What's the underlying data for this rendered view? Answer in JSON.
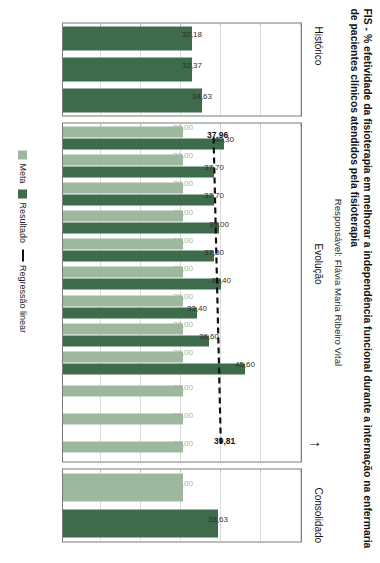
{
  "header": {
    "title": "FIS - % efetividade da fisioterapia em melhorar a independência funcional durante a internação na enfermaria de pacientes clínicos atendidos pela fisioterapia",
    "subtitle": "Responsável: Flávia Maria Ribeiro Vital"
  },
  "bands": {
    "historico": "Histórico",
    "evolucao": "Evolução",
    "consolidado": "Consolidado"
  },
  "legend": {
    "meta": "Meta",
    "resultado": "Resultado",
    "regressao": "Regressão linear"
  },
  "axis": {
    "ylabel": "%",
    "xlabel": "Mês/ano",
    "yticks": [
      "60,00",
      "50,00",
      "40,00",
      "30,00",
      "20,00",
      "10,00",
      "0,00"
    ],
    "period_evolucao": "2016"
  },
  "colors": {
    "meta": "#9db89f",
    "resultado": "#3e6b4b",
    "regressao": "#111111",
    "panel_border": "#7b7b7b",
    "grid": "#b9b9b9"
  },
  "chart_data": {
    "type": "bar",
    "title": "FIS - % efetividade da fisioterapia em melhorar a independência funcional durante a internação na enfermaria de pacientes clínicos atendidos pela fisioterapia",
    "subtitle": "Responsável: Flávia Maria Ribeiro Vital",
    "xlabel": "Mês/ano",
    "ylabel": "%",
    "ylim": [
      0,
      60
    ],
    "ytick_step": 10,
    "grid": true,
    "legend_position": "bottom",
    "orientation": "vertical-bars",
    "panels": [
      {
        "name": "Histórico",
        "categories": [
          "2013",
          "2014",
          "2015"
        ],
        "series": [
          {
            "name": "Resultado",
            "values": [
              32.18,
              32.37,
              34.63
            ],
            "labels": [
              "32,18",
              "32,37",
              "34,63"
            ]
          }
        ]
      },
      {
        "name": "Evolução",
        "period": "2016",
        "categories": [
          "Jan",
          "Fev",
          "Mar",
          "Abr",
          "Mai",
          "Jun",
          "Jul",
          "Ago",
          "Set",
          "Out",
          "Nov",
          "Dez"
        ],
        "series": [
          {
            "name": "Meta",
            "values": [
              30.0,
              30.0,
              30.0,
              30.0,
              30.0,
              30.0,
              30.0,
              30.0,
              30.0,
              30.0,
              30.0,
              30.0
            ],
            "labels": [
              "30,00",
              "30,00",
              "30,00",
              "30,00",
              "30,00",
              "30,00",
              "30,00",
              "30,00",
              "30,00",
              "30,00",
              "30,00",
              "30,00"
            ]
          },
          {
            "name": "Resultado",
            "values": [
              40.3,
              37.7,
              37.7,
              39.0,
              37.8,
              39.4,
              33.4,
              36.6,
              45.6,
              null,
              null,
              null
            ],
            "labels": [
              "40,30",
              "37,70",
              "37,70",
              "39,00",
              "37,80",
              "39,40",
              "33,40",
              "36,60",
              "45,60",
              "",
              "",
              ""
            ]
          }
        ],
        "regression": {
          "name": "Regressão linear",
          "start_value": 37.96,
          "end_value": 39.81,
          "start_label": "37,96",
          "end_label": "39,81"
        }
      },
      {
        "name": "Consolidado",
        "categories": [
          "16",
          "16"
        ],
        "series": [
          {
            "name": "Meta",
            "values": [
              30.0
            ],
            "labels": [
              "30,00"
            ]
          },
          {
            "name": "Resultado",
            "values": [
              38.63
            ],
            "labels": [
              "38,63"
            ]
          }
        ]
      }
    ]
  }
}
